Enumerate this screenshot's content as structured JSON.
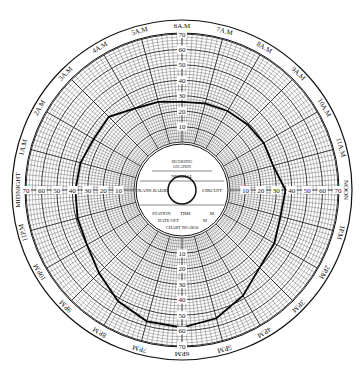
{
  "chart_data": {
    "type": "line",
    "subtype": "circular-chart-recorder",
    "title": "",
    "center_label": {
      "recording": "RECORDING",
      "location": "LOCATION",
      "normal": "NORMAL",
      "left": "TRANS.RADIO",
      "right": "CIRCUIT",
      "station": "STATION",
      "time": "TIME",
      "m1": "M.",
      "date_off": "DATE OFF",
      "m2": "M",
      "chart_no": "CHART NO.3810"
    },
    "time_labels": [
      "NOON",
      "1P.M",
      "2P.M",
      "3P.M",
      "4P.M",
      "5P.M",
      "6P.M",
      "7P.M",
      "8P.M",
      "9P.M",
      "10P.M",
      "11P.M",
      "MIDNIGHT",
      "1A.M",
      "2A.M",
      "3A.M",
      "4A.M",
      "5A.M",
      "6A.M",
      "7A.M",
      "8A.M",
      "9A.M",
      "10A.M",
      "11A.M"
    ],
    "radial_scale": {
      "min": 0,
      "max": 70,
      "ticks": [
        10,
        20,
        30,
        40,
        50,
        60,
        70
      ]
    },
    "series": [
      {
        "name": "recorded trace",
        "x_hours": [
          0,
          1,
          2,
          3,
          4,
          5,
          6,
          7,
          8,
          9,
          10,
          11,
          12,
          13,
          14,
          15,
          16,
          17,
          18,
          19,
          20,
          21,
          22,
          23
        ],
        "values": [
          38,
          37,
          35,
          36,
          30,
          28,
          26,
          27,
          28,
          29,
          30,
          30,
          36,
          35,
          38,
          40,
          48,
          55,
          58,
          57,
          52,
          45,
          40,
          39
        ]
      }
    ],
    "grid": true
  }
}
